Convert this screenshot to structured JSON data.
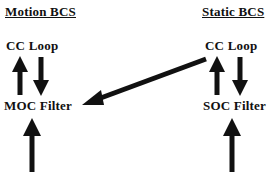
{
  "diagram": {
    "title_absent": true,
    "background_color": "#ffffff",
    "ink_color": "#111111",
    "columns": [
      {
        "id": "motion",
        "heading": "Motion BCS",
        "nodes": [
          {
            "id": "motion-cc-loop",
            "label": "CC Loop"
          },
          {
            "id": "moc-filter",
            "label": "MOC Filter"
          }
        ]
      },
      {
        "id": "static",
        "heading": "Static BCS",
        "nodes": [
          {
            "id": "static-cc-loop",
            "label": "CC Loop"
          },
          {
            "id": "soc-filter",
            "label": "SOC Filter"
          }
        ]
      }
    ],
    "arrows": [
      {
        "id": "motion-up-arrow",
        "name": "arrow-moc-filter-to-cc-loop",
        "direction": "up",
        "from": "MOC Filter",
        "to": "CC Loop",
        "column": "motion"
      },
      {
        "id": "motion-down-arrow",
        "name": "arrow-cc-loop-to-moc-filter",
        "direction": "down",
        "from": "CC Loop",
        "to": "MOC Filter",
        "column": "motion"
      },
      {
        "id": "motion-input-arrow",
        "name": "arrow-input-to-moc-filter",
        "direction": "up",
        "from": "input",
        "to": "MOC Filter",
        "column": "motion"
      },
      {
        "id": "static-up-arrow",
        "name": "arrow-soc-filter-to-cc-loop",
        "direction": "up",
        "from": "SOC Filter",
        "to": "CC Loop",
        "column": "static"
      },
      {
        "id": "static-down-arrow",
        "name": "arrow-cc-loop-to-soc-filter",
        "direction": "down",
        "from": "CC Loop",
        "to": "SOC Filter",
        "column": "static"
      },
      {
        "id": "static-input-arrow",
        "name": "arrow-input-to-soc-filter",
        "direction": "up",
        "from": "input",
        "to": "SOC Filter",
        "column": "static"
      },
      {
        "id": "cross-arrow",
        "name": "arrow-static-cc-loop-to-moc-filter",
        "direction": "diagonal-down-left",
        "from": "Static BCS CC Loop",
        "to": "MOC Filter",
        "column": "cross"
      }
    ]
  }
}
